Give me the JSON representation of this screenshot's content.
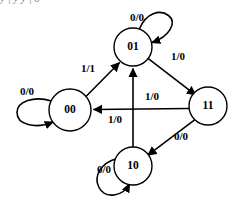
{
  "page": {
    "clipped_top_text": "y     |     y          y     |     0"
  },
  "diagram": {
    "type": "state-transition-diagram",
    "states": [
      {
        "id": "s00",
        "label": "00",
        "cx": 70,
        "cy": 110,
        "r": 21
      },
      {
        "id": "s01",
        "label": "01",
        "cx": 133,
        "cy": 47,
        "r": 19
      },
      {
        "id": "s11",
        "label": "11",
        "cx": 208,
        "cy": 106,
        "r": 19
      },
      {
        "id": "s10",
        "label": "10",
        "cx": 133,
        "cy": 166,
        "r": 19
      }
    ],
    "transitions": [
      {
        "from": "s00",
        "to": "s01",
        "label": "1/1",
        "lx": 88,
        "ly": 69
      },
      {
        "from": "s01",
        "to": "s11",
        "label": "1/0",
        "lx": 178,
        "ly": 57
      },
      {
        "from": "s11",
        "to": "s00",
        "label": "1/0",
        "lx": 152,
        "ly": 97
      },
      {
        "from": "s11",
        "to": "s10",
        "label": "0/0",
        "lx": 181,
        "ly": 137
      },
      {
        "from": "s10",
        "to": "s01",
        "label": "1/0",
        "lx": 115,
        "ly": 120
      }
    ],
    "self_loops": [
      {
        "state": "s00",
        "label": "0/0",
        "lx": 27,
        "ly": 92
      },
      {
        "state": "s01",
        "label": "0/0",
        "lx": 137,
        "ly": 18
      },
      {
        "state": "s10",
        "label": "0/0",
        "lx": 104,
        "ly": 170
      }
    ]
  }
}
